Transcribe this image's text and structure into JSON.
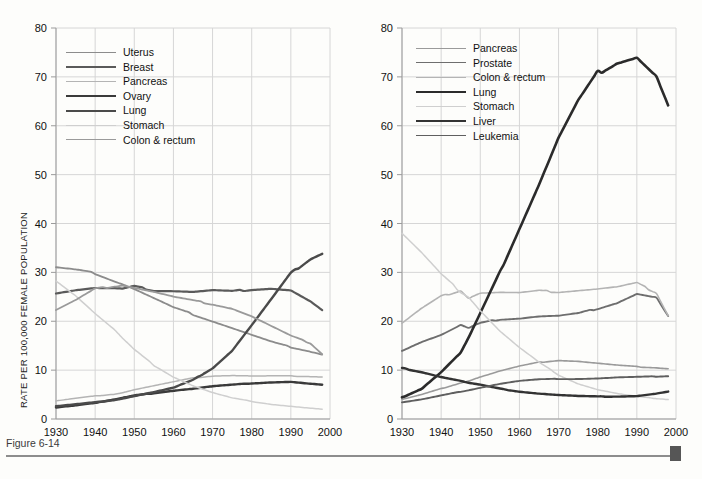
{
  "caption": {
    "text": "Figure 6-14"
  },
  "axis": {
    "y_ticks": [
      0,
      10,
      20,
      30,
      40,
      50,
      60,
      70,
      80
    ],
    "x_ticks": [
      1930,
      1940,
      1950,
      1960,
      1970,
      1980,
      1990,
      2000
    ],
    "ylim": [
      0,
      80
    ],
    "xlim": [
      1930,
      2000
    ]
  },
  "colors": {
    "uterus": "#8c8c8c",
    "breast": "#5a5a5a",
    "pancreas": "#b4b4b4",
    "ovary": "#3a3a3a",
    "lung_female": "#4a4a4a",
    "stomach": "#cfcfcf",
    "colon": "#9a9a9a",
    "prostate": "#6e6e6e",
    "lung_male": "#2b2b2b",
    "liver": "#333333",
    "leukemia": "#5f5f5f",
    "grid": "#d6d6d6",
    "axis": "#9b9b9b",
    "rule": "#8d8d8d",
    "corner": "#565656"
  },
  "chart_data": [
    {
      "type": "line",
      "panel": "left",
      "title": "",
      "xlabel": "",
      "ylabel": "RATE PER 100,000 FEMALE POPULATION",
      "xlim": [
        1930,
        2000
      ],
      "ylim": [
        0,
        80
      ],
      "grid": true,
      "legend_position": "top-left",
      "x": [
        1930,
        1935,
        1940,
        1945,
        1947,
        1950,
        1955,
        1960,
        1965,
        1970,
        1975,
        1980,
        1985,
        1990,
        1995,
        1998
      ],
      "series": [
        {
          "name": "Uterus",
          "values": [
            31.0,
            30.5,
            29.8,
            28.2,
            27.6,
            26.6,
            24.7,
            22.8,
            21.4,
            20.0,
            18.6,
            17.2,
            15.8,
            14.7,
            13.8,
            13.2
          ],
          "color": "#8c8c8c"
        },
        {
          "name": "Breast",
          "values": [
            25.8,
            26.4,
            26.8,
            26.7,
            26.6,
            27.1,
            26.3,
            26.2,
            26.0,
            26.3,
            26.1,
            26.5,
            26.7,
            26.3,
            24.0,
            22.2
          ],
          "color": "#5a5a5a"
        },
        {
          "name": "Pancreas",
          "values": [
            3.7,
            4.2,
            4.7,
            5.1,
            5.4,
            6.0,
            6.8,
            7.6,
            8.4,
            8.8,
            8.9,
            8.8,
            8.8,
            8.8,
            8.7,
            8.6
          ],
          "color": "#b4b4b4"
        },
        {
          "name": "Ovary",
          "values": [
            2.4,
            2.8,
            3.3,
            4.0,
            4.3,
            4.8,
            5.3,
            5.8,
            6.2,
            6.7,
            7.0,
            7.3,
            7.5,
            7.6,
            7.2,
            7.0
          ],
          "color": "#3a3a3a"
        },
        {
          "name": "Lung",
          "values": [
            2.6,
            3.0,
            3.4,
            3.9,
            4.2,
            4.7,
            5.5,
            6.4,
            8.0,
            10.4,
            14.0,
            19.2,
            24.5,
            29.8,
            32.8,
            33.9
          ],
          "color": "#4a4a4a"
        },
        {
          "name": "Stomach",
          "values": [
            28.4,
            25.3,
            21.6,
            18.2,
            16.5,
            14.2,
            11.0,
            8.6,
            6.8,
            5.4,
            4.3,
            3.6,
            3.0,
            2.6,
            2.2,
            2.0
          ],
          "color": "#cfcfcf"
        },
        {
          "name": "Colon & rectum",
          "values": [
            22.3,
            24.3,
            26.6,
            27.2,
            27.4,
            26.9,
            26.0,
            25.0,
            24.2,
            23.5,
            22.6,
            21.0,
            19.0,
            17.0,
            15.5,
            13.3
          ],
          "color": "#9a9a9a"
        }
      ]
    },
    {
      "type": "line",
      "panel": "right",
      "title": "",
      "xlabel": "",
      "ylabel": "RATE PER 100,000 MALE POPULATION",
      "xlim": [
        1930,
        2000
      ],
      "ylim": [
        0,
        80
      ],
      "grid": true,
      "legend_position": "top-left",
      "x": [
        1930,
        1935,
        1940,
        1945,
        1947,
        1950,
        1955,
        1960,
        1965,
        1970,
        1975,
        1980,
        1985,
        1990,
        1995,
        1998
      ],
      "series": [
        {
          "name": "Pancreas",
          "values": [
            4.0,
            5.0,
            6.2,
            7.4,
            7.8,
            8.6,
            9.8,
            10.8,
            11.6,
            12.0,
            11.8,
            11.4,
            11.0,
            10.7,
            10.5,
            10.3
          ],
          "color": "#9a9a9a"
        },
        {
          "name": "Prostate",
          "values": [
            14.0,
            15.8,
            17.2,
            19.2,
            18.6,
            19.6,
            20.4,
            20.6,
            21.0,
            21.1,
            21.6,
            22.6,
            23.8,
            25.6,
            24.8,
            21.0
          ],
          "color": "#6e6e6e"
        },
        {
          "name": "Colon & rectum",
          "values": [
            19.6,
            22.6,
            25.1,
            26.3,
            24.8,
            25.8,
            25.9,
            25.8,
            26.2,
            26.0,
            26.3,
            26.6,
            27.0,
            27.8,
            25.8,
            21.2
          ],
          "color": "#b4b4b4"
        },
        {
          "name": "Lung",
          "values": [
            4.4,
            6.2,
            9.6,
            13.6,
            16.6,
            21.6,
            30.0,
            39.0,
            48.0,
            57.5,
            65.0,
            70.8,
            73.0,
            74.0,
            70.0,
            64.0
          ],
          "color": "#2b2b2b"
        },
        {
          "name": "Stomach",
          "values": [
            38.0,
            34.0,
            29.6,
            26.0,
            25.0,
            22.2,
            18.0,
            14.6,
            11.6,
            9.0,
            7.2,
            6.0,
            5.2,
            4.6,
            4.2,
            4.0
          ],
          "color": "#cfcfcf"
        },
        {
          "name": "Liver",
          "values": [
            10.4,
            9.6,
            8.6,
            7.8,
            7.4,
            7.0,
            6.2,
            5.6,
            5.2,
            4.9,
            4.7,
            4.6,
            4.6,
            4.7,
            5.2,
            5.6
          ],
          "color": "#333333"
        },
        {
          "name": "Leukemia",
          "values": [
            3.4,
            4.0,
            4.8,
            5.6,
            5.9,
            6.4,
            7.2,
            7.8,
            8.1,
            8.2,
            8.2,
            8.3,
            8.5,
            8.6,
            8.7,
            8.8
          ],
          "color": "#5f5f5f"
        }
      ]
    }
  ],
  "legends": {
    "left": [
      {
        "label": "Uterus",
        "color": "#8c8c8c",
        "width": 1.8
      },
      {
        "label": "Breast",
        "color": "#5a5a5a",
        "width": 2.2
      },
      {
        "label": "Pancreas",
        "color": "#b4b4b4",
        "width": 1.5
      },
      {
        "label": "Ovary",
        "color": "#3a3a3a",
        "width": 2.4
      },
      {
        "label": "Lung",
        "color": "#4a4a4a",
        "width": 2.4
      },
      {
        "label": "Stomach",
        "color": "#cfcfcf",
        "width": 1.5
      },
      {
        "label": "Colon & rectum",
        "color": "#9a9a9a",
        "width": 1.8
      }
    ],
    "right": [
      {
        "label": "Pancreas",
        "color": "#9a9a9a",
        "width": 1.6
      },
      {
        "label": "Prostate",
        "color": "#6e6e6e",
        "width": 1.9
      },
      {
        "label": "Colon & rectum",
        "color": "#b4b4b4",
        "width": 1.6
      },
      {
        "label": "Lung",
        "color": "#2b2b2b",
        "width": 2.6
      },
      {
        "label": "Stomach",
        "color": "#cfcfcf",
        "width": 1.5
      },
      {
        "label": "Liver",
        "color": "#333333",
        "width": 2.4
      },
      {
        "label": "Leukemia",
        "color": "#5f5f5f",
        "width": 1.9
      }
    ]
  }
}
